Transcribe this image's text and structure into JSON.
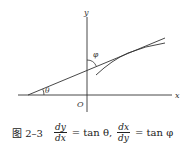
{
  "figure": {
    "axes": {
      "x_label": "x",
      "y_label": "y",
      "origin_label": "O"
    },
    "angles": {
      "theta_label": "θ",
      "phi_label": "φ"
    },
    "elements": [
      "x-axis",
      "y-axis",
      "tangent-line",
      "curve",
      "theta-arc",
      "phi-arc"
    ],
    "colors": {
      "stroke": "#333333",
      "background": "#ffffff"
    }
  },
  "caption": {
    "figure_number": "图 2–3",
    "eq1": {
      "num": "dy",
      "den": "dx",
      "rhs": "= tan θ,"
    },
    "eq2": {
      "num": "dx",
      "den": "dy",
      "rhs": "= tan φ"
    }
  }
}
